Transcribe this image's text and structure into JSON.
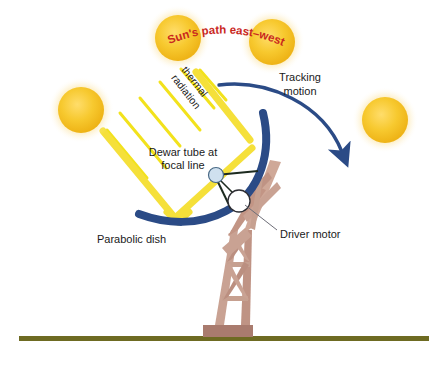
{
  "diagram": {
    "background_color": "#ffffff"
  },
  "labels": {
    "sun_path": "Sun's path east–west",
    "thermal_radiation": "thermal radiation",
    "thermal_radiation_line1": "thermal",
    "thermal_radiation_line2": "radiation",
    "tracking_motion_line1": "Tracking",
    "tracking_motion_line2": "motion",
    "dewar_tube_line1": "Dewar tube at",
    "dewar_tube_line2": "focal line",
    "parabolic_dish": "Parabolic dish",
    "driver_motor": "Driver motor"
  },
  "colors": {
    "sun_fill": "#f5c431",
    "sun_fill_light": "#ffd75e",
    "sun_glow": "#fbe3a0",
    "sun_path_text": "#c9281e",
    "ray_yellow": "#f2e21c",
    "beam_yellow": "#f5e03a",
    "dish_navy": "#2b4b86",
    "arrow_navy": "#2b4b86",
    "tower_tan": "#cfa898",
    "tower_tan_dark": "#b9897a",
    "tower_base": "#a97b6e",
    "ground_olive": "#6e6b22",
    "dewar_fill": "#cfe0ef",
    "motor_fill": "#ffffff",
    "strut_dark": "#1d2b20",
    "label_text": "#1a1a1a",
    "leader_line": "#6e6e78"
  },
  "suns": [
    {
      "name": "sun-left",
      "cx": 81,
      "cy": 110,
      "r": 23
    },
    {
      "name": "sun-top-left",
      "cx": 178,
      "cy": 38,
      "r": 23
    },
    {
      "name": "sun-top-right",
      "cx": 272,
      "cy": 42,
      "r": 23
    },
    {
      "name": "sun-right",
      "cx": 385,
      "cy": 120,
      "r": 23
    }
  ],
  "elements": {
    "sun_count": 4,
    "ray_count": 6,
    "ground_y": 338,
    "tower_base_label": "tower base plate"
  }
}
